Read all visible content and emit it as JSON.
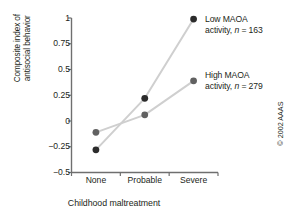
{
  "chart_data": {
    "type": "line",
    "title": "",
    "xlabel": "Childhood maltreatment",
    "ylabel_line1": "Composite index of",
    "ylabel_line2": "antisocial behavior",
    "categories": [
      "None",
      "Probable",
      "Severe"
    ],
    "ylim": [
      -0.5,
      1
    ],
    "yticks": [
      "1",
      "0.75",
      "0.5",
      "0.25",
      "0",
      "−0.25",
      "−0.5"
    ],
    "ytick_values": [
      1,
      0.75,
      0.5,
      0.25,
      0,
      -0.25,
      -0.5
    ],
    "grid": false,
    "legend_position": "right-inline-at-last-point",
    "series": [
      {
        "name": "Low MAOA activity",
        "n": 163,
        "label_line1": "Low MAOA",
        "label_line2_pre": "activity, ",
        "label_line2_ital": "n",
        "label_line2_post": " = 163",
        "values": [
          -0.28,
          0.22,
          0.99
        ],
        "marker_color": "#2b2b2b",
        "line_color": "#cfcfcf"
      },
      {
        "name": "High MAOA activity",
        "n": 279,
        "label_line1": "High MAOA",
        "label_line2_pre": "activity, ",
        "label_line2_ital": "n",
        "label_line2_post": " = 279",
        "values": [
          -0.11,
          0.06,
          0.39
        ],
        "marker_color": "#616161",
        "line_color": "#cfcfcf"
      }
    ]
  },
  "credit": {
    "text": "© 2002 AAAS"
  },
  "colors": {
    "axis": "#6f6f6f",
    "text": "#231f20",
    "connector": "#cfcfcf"
  }
}
